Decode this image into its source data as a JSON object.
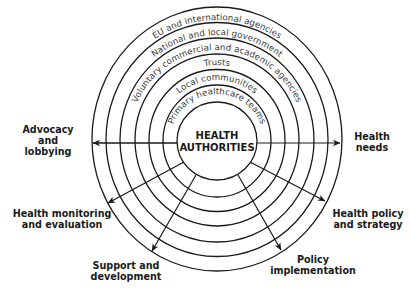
{
  "diagram": {
    "center": {
      "line1": "HEALTH",
      "line2": "AUTHORITIES"
    },
    "rings": [
      {
        "label": "Primary healthcare teams"
      },
      {
        "label": "Local communities"
      },
      {
        "label": "Trusts"
      },
      {
        "label": "Voluntary commercial and academic agencies"
      },
      {
        "label": "National and local government"
      },
      {
        "label": "EU and international agencies"
      }
    ],
    "outcomes": {
      "advocacy": {
        "line1": "Advocacy",
        "line2": "and",
        "line3": "lobbying"
      },
      "health_needs": {
        "line1": "Health",
        "line2": "needs"
      },
      "monitoring": {
        "line1": "Health monitoring",
        "line2": "and evaluation"
      },
      "policy_strategy": {
        "line1": "Health policy",
        "line2": "and strategy"
      },
      "support": {
        "line1": "Support and",
        "line2": "development"
      },
      "implementation": {
        "line1": "Policy",
        "line2": "implementation"
      }
    },
    "colors": {
      "stroke": "#1a1a1a",
      "ring_text": "#3a3a3a",
      "background": "#ffffff"
    }
  }
}
